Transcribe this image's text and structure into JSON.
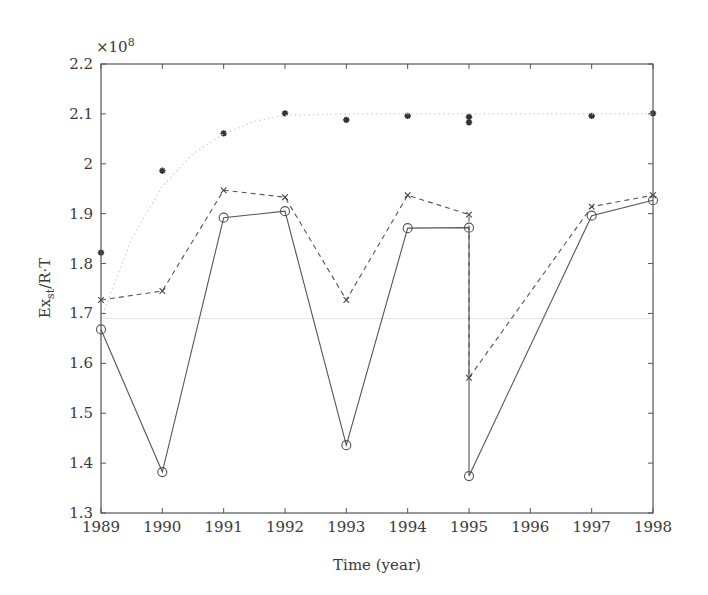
{
  "chart_data": {
    "type": "line",
    "title": "",
    "xlabel": "Time (year)",
    "ylabel": "Ex_st/R·T",
    "ylabel_main": "Ex",
    "ylabel_sub": "st",
    "ylabel_rest": "/R·T",
    "y_multiplier": "×10",
    "y_multiplier_exp": "8",
    "xlim": [
      1989,
      1998
    ],
    "ylim": [
      1.3,
      2.2
    ],
    "grid": false,
    "legend": null,
    "x_ticks": [
      1989,
      1990,
      1991,
      1992,
      1993,
      1994,
      1995,
      1996,
      1997,
      1998
    ],
    "x_tick_labels": [
      "1989",
      "1990",
      "1991",
      "1992",
      "1993",
      "1994",
      "1995",
      "1996",
      "1997",
      "1998"
    ],
    "y_ticks": [
      1.3,
      1.4,
      1.5,
      1.6,
      1.7,
      1.8,
      1.9,
      2.0,
      2.1,
      2.2
    ],
    "y_tick_labels": [
      "1.3",
      "1.4",
      "1.5",
      "1.6",
      "1.7",
      "1.8",
      "1.9",
      "2",
      "2.1",
      "2.2"
    ],
    "series": [
      {
        "name": "star markers",
        "style": "markers-only",
        "marker": "asterisk",
        "x": [
          1989,
          1990,
          1991,
          1992,
          1993,
          1994,
          1995,
          1995,
          1997,
          1998
        ],
        "y": [
          1.822,
          1.986,
          2.061,
          2.101,
          2.088,
          2.096,
          2.094,
          2.083,
          2.096,
          2.101
        ]
      },
      {
        "name": "dotted fit curve",
        "style": "dotted",
        "marker": "none",
        "x": [
          1989,
          1989.5,
          1990,
          1990.5,
          1991,
          1991.5,
          1992,
          1993,
          1994,
          1995,
          1996,
          1997,
          1998
        ],
        "y": [
          1.69,
          1.85,
          1.955,
          2.02,
          2.06,
          2.085,
          2.097,
          2.1,
          2.1,
          2.1,
          2.1,
          2.1,
          2.1
        ]
      },
      {
        "name": "dashed x-marker series",
        "style": "dashed",
        "marker": "x",
        "x": [
          1989,
          1990,
          1991,
          1992,
          1993,
          1994,
          1995,
          1995,
          1997,
          1998
        ],
        "y": [
          1.727,
          1.745,
          1.947,
          1.933,
          1.727,
          1.937,
          1.898,
          1.571,
          1.914,
          1.937
        ]
      },
      {
        "name": "solid circle series",
        "style": "solid",
        "marker": "circle",
        "x": [
          1989,
          1990,
          1991,
          1992,
          1993,
          1994,
          1995,
          1995,
          1997,
          1998
        ],
        "y": [
          1.668,
          1.382,
          1.892,
          1.905,
          1.436,
          1.871,
          1.872,
          1.374,
          1.896,
          1.927
        ]
      }
    ],
    "reference_line": {
      "style": "faint",
      "y": 1.69
    }
  }
}
